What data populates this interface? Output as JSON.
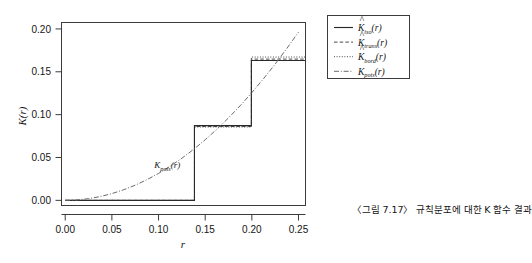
{
  "figure": {
    "caption": "〈그림 7.17〉 규칙분포에 대한 K 함수 결과"
  },
  "axes": {
    "x_title": "r",
    "y_title": "K(r)",
    "x_ticks": [
      "0.00",
      "0.05",
      "0.10",
      "0.15",
      "0.20",
      "0.25"
    ],
    "y_ticks": [
      "0.00",
      "0.05",
      "0.10",
      "0.15",
      "0.20"
    ]
  },
  "legend": {
    "items": [
      {
        "base": "K",
        "hat": "^",
        "sub": "iso",
        "arg": "(r)",
        "style": "solid"
      },
      {
        "base": "K",
        "hat": "^",
        "sub": "trans",
        "arg": "(r)",
        "style": "dashed"
      },
      {
        "base": "K",
        "hat": "^",
        "sub": "bord",
        "arg": "(r)",
        "style": "dotted"
      },
      {
        "base": "K",
        "hat": "",
        "sub": "pois",
        "arg": "(r)",
        "style": "dashdot"
      }
    ]
  },
  "annotations": [
    {
      "base": "K",
      "sub": "pois",
      "arg": "(r)",
      "x": 0.0955,
      "y": 0.0375
    }
  ],
  "chart_data": {
    "type": "line",
    "title": "",
    "xlabel": "r",
    "ylabel": "K(r)",
    "xlim": [
      -0.004,
      0.2575
    ],
    "ylim": [
      -0.006,
      0.2075
    ],
    "xticks": [
      0.0,
      0.05,
      0.1,
      0.15,
      0.2,
      0.25
    ],
    "yticks": [
      0.0,
      0.05,
      0.1,
      0.15,
      0.2
    ],
    "grid": false,
    "legend_position": "outside-top-right",
    "series": [
      {
        "name": "K_iso(r)",
        "style": "solid",
        "type": "step",
        "x": [
          0.0,
          0.1385,
          0.1385,
          0.1995,
          0.1995,
          0.2575
        ],
        "y": [
          0.0,
          0.0,
          0.0872,
          0.0872,
          0.1632,
          0.1632
        ]
      },
      {
        "name": "K_trans(r)",
        "style": "dashed",
        "type": "step",
        "x": [
          0.0,
          0.1385,
          0.1385,
          0.1995,
          0.1995,
          0.2575
        ],
        "y": [
          0.0,
          0.0,
          0.0862,
          0.0862,
          0.1648,
          0.1648
        ]
      },
      {
        "name": "K_bord(r)",
        "style": "dotted",
        "type": "step",
        "x": [
          0.0,
          0.1385,
          0.1385,
          0.1995,
          0.1995,
          0.2575
        ],
        "y": [
          0.0,
          0.0,
          0.0856,
          0.0856,
          0.1672,
          0.1672
        ]
      },
      {
        "name": "K_pois(r)",
        "style": "dashdot",
        "type": "curve",
        "description": "Theoretical Poisson K function, pi*r^2",
        "x": [
          0.0,
          0.0125,
          0.025,
          0.0375,
          0.05,
          0.0625,
          0.075,
          0.0875,
          0.1,
          0.1125,
          0.125,
          0.1375,
          0.15,
          0.1625,
          0.175,
          0.1875,
          0.2,
          0.2125,
          0.225,
          0.2375,
          0.25
        ],
        "y": [
          0.0,
          0.0005,
          0.002,
          0.0044,
          0.0079,
          0.0123,
          0.0177,
          0.0241,
          0.0314,
          0.0398,
          0.0491,
          0.0594,
          0.0707,
          0.083,
          0.0962,
          0.1104,
          0.1257,
          0.1419,
          0.159,
          0.1772,
          0.1963
        ]
      }
    ]
  }
}
